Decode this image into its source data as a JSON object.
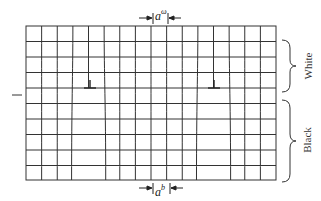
{
  "diagram": {
    "type": "crystal-lattice-interface",
    "grid": {
      "left": 26,
      "right": 276,
      "top": 26,
      "bottom": 180,
      "interface_y": 95,
      "columns": 16,
      "rows": 10,
      "line_color": "#333333"
    },
    "labels": {
      "top_spacing_base": "a",
      "top_spacing_sup": "ω",
      "bottom_spacing_base": "a",
      "bottom_spacing_sup": "b",
      "white_region": "White",
      "black_region": "Black"
    },
    "dislocations": [
      {
        "symbol": "⊥",
        "x": 90,
        "y": 88
      },
      {
        "symbol": "⊥",
        "x": 214,
        "y": 88
      }
    ],
    "interface_marker": {
      "x1": 12,
      "x2": 22,
      "y": 95
    }
  }
}
